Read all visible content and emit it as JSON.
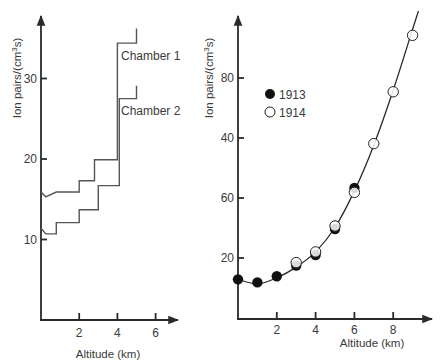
{
  "chart_data": [
    {
      "type": "line",
      "subtype": "step",
      "title": "",
      "xlabel": "Altitude (km)",
      "ylabel": "Ion pairs/(cm³s)",
      "ylabel_main": "Ion pairs/(cm",
      "ylabel_sup": "3",
      "ylabel_end": "s)",
      "xticks": [
        2,
        4,
        6
      ],
      "yticks": [
        10,
        20,
        30
      ],
      "xlim": [
        0,
        7
      ],
      "ylim": [
        0,
        38
      ],
      "grid": false,
      "legend": "inline labels",
      "series": [
        {
          "name": "Chamber 1",
          "x": [
            0,
            0.25,
            0.8,
            2.0,
            2.0,
            2.8,
            2.8,
            4.0,
            4.0,
            5.0,
            5.0
          ],
          "y": [
            15.9,
            15.3,
            15.9,
            15.9,
            17.3,
            17.3,
            19.9,
            19.9,
            34.4,
            34.4,
            36.2
          ]
        },
        {
          "name": "Chamber 2",
          "x": [
            0,
            0.25,
            0.8,
            0.8,
            2.0,
            2.0,
            3.0,
            3.0,
            4.1,
            4.1,
            5.0,
            5.0
          ],
          "y": [
            11.4,
            10.7,
            10.7,
            12.1,
            12.1,
            13.7,
            13.7,
            16.7,
            16.7,
            27.5,
            27.5,
            29.1
          ]
        }
      ]
    },
    {
      "type": "scatter",
      "title": "",
      "xlabel": "Altitude (km)",
      "ylabel": "Ion pairs/(cm³s)",
      "ylabel_main": "Ion pairs/(cm",
      "ylabel_sup": "3",
      "ylabel_end": "s)",
      "xticks": [
        2,
        4,
        6,
        8
      ],
      "ytick_labels_bottom_to_top": [
        "20",
        "60",
        "40",
        "80"
      ],
      "xlim": [
        0,
        10
      ],
      "ylim": [
        0,
        100
      ],
      "grid": false,
      "legend_position": "upper left",
      "series": [
        {
          "name": "1913",
          "marker": "filled-circle",
          "x": [
            0,
            1,
            2,
            3,
            4,
            5,
            6
          ],
          "y": [
            13,
            12,
            14,
            17.5,
            21,
            29.5,
            43
          ]
        },
        {
          "name": "1914",
          "marker": "open-circle",
          "x": [
            3,
            4,
            5,
            6,
            7,
            8,
            9
          ],
          "y": [
            18.5,
            22,
            30.5,
            41.5,
            57.5,
            74.5,
            93
          ]
        }
      ],
      "fit_curve": {
        "x": [
          0,
          1,
          2,
          3,
          4,
          5,
          6,
          7,
          8,
          9,
          9.3
        ],
        "y": [
          13,
          11.5,
          13.5,
          17,
          22,
          30,
          42,
          57,
          75,
          95,
          101
        ]
      }
    }
  ]
}
